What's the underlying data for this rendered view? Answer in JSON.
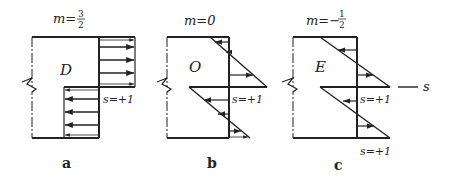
{
  "figure": {
    "panels": [
      {
        "id": "a",
        "caption": "a",
        "m_label": "m=",
        "m_num": "3",
        "m_den": "2",
        "m_sign": "",
        "region_label": "D",
        "s_label": "s=+1"
      },
      {
        "id": "b",
        "caption": "b",
        "m_label": "m=0",
        "region_label": "O",
        "s_label": "s=+1"
      },
      {
        "id": "c",
        "caption": "c",
        "m_label": "m=−",
        "m_num": "1",
        "m_den": "2",
        "region_label": "E",
        "s_label_upper": "s=+1",
        "s_label_lower": "s=+1",
        "axis_label": "s"
      }
    ],
    "colors": {
      "line": "#222222",
      "background": "#ffffff"
    }
  }
}
